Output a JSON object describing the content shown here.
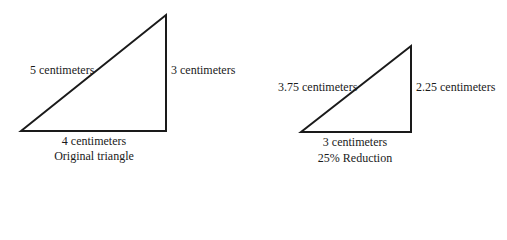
{
  "diagram": {
    "stroke_color": "#1a1a1a",
    "background": "#ffffff",
    "triangles": [
      {
        "id": "original",
        "caption": "Original triangle",
        "hypotenuse_label": "5 centimeters",
        "vertical_leg_label": "3 centimeters",
        "base_label": "4 centimeters",
        "hypotenuse": 5,
        "vertical_leg": 3,
        "base": 4,
        "unit": "centimeters"
      },
      {
        "id": "reduced",
        "caption": "25% Reduction",
        "hypotenuse_label": "3.75 centimeters",
        "vertical_leg_label": "2.25 centimeters",
        "base_label": "3 centimeters",
        "hypotenuse": 3.75,
        "vertical_leg": 2.25,
        "base": 3,
        "unit": "centimeters",
        "reduction_percent": 25
      }
    ]
  }
}
